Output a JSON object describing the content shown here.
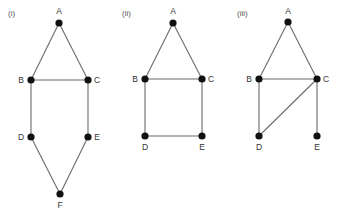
{
  "graphs": [
    {
      "label": "(i)",
      "label_pos": [
        8,
        16
      ],
      "nodes": [
        {
          "id": "A",
          "x": 59,
          "y": 23,
          "lx": 59,
          "ly": 14,
          "anchor": "middle"
        },
        {
          "id": "B",
          "x": 31,
          "y": 80,
          "lx": 21,
          "ly": 83,
          "anchor": "middle"
        },
        {
          "id": "C",
          "x": 88,
          "y": 80,
          "lx": 97,
          "ly": 83,
          "anchor": "middle"
        },
        {
          "id": "D",
          "x": 31,
          "y": 137,
          "lx": 21,
          "ly": 140,
          "anchor": "middle"
        },
        {
          "id": "E",
          "x": 88,
          "y": 137,
          "lx": 97,
          "ly": 140,
          "anchor": "middle"
        },
        {
          "id": "F",
          "x": 60,
          "y": 194,
          "lx": 60,
          "ly": 208,
          "anchor": "middle"
        }
      ],
      "edges": [
        [
          "A",
          "B"
        ],
        [
          "A",
          "C"
        ],
        [
          "B",
          "C"
        ],
        [
          "B",
          "D"
        ],
        [
          "C",
          "E"
        ],
        [
          "D",
          "F"
        ],
        [
          "E",
          "F"
        ]
      ]
    },
    {
      "label": "(ii)",
      "label_pos": [
        122,
        16
      ],
      "nodes": [
        {
          "id": "A",
          "x": 173,
          "y": 23,
          "lx": 173,
          "ly": 14,
          "anchor": "middle"
        },
        {
          "id": "B",
          "x": 145,
          "y": 79,
          "lx": 135,
          "ly": 82,
          "anchor": "middle"
        },
        {
          "id": "C",
          "x": 202,
          "y": 79,
          "lx": 211,
          "ly": 82,
          "anchor": "middle"
        },
        {
          "id": "D",
          "x": 145,
          "y": 136,
          "lx": 145,
          "ly": 150,
          "anchor": "middle"
        },
        {
          "id": "E",
          "x": 202,
          "y": 136,
          "lx": 202,
          "ly": 150,
          "anchor": "middle"
        }
      ],
      "edges": [
        [
          "A",
          "B"
        ],
        [
          "A",
          "C"
        ],
        [
          "B",
          "C"
        ],
        [
          "B",
          "D"
        ],
        [
          "C",
          "E"
        ],
        [
          "D",
          "E"
        ]
      ]
    },
    {
      "label": "(iii)",
      "label_pos": [
        237,
        16
      ],
      "nodes": [
        {
          "id": "A",
          "x": 288,
          "y": 22,
          "lx": 288,
          "ly": 14,
          "anchor": "middle"
        },
        {
          "id": "B",
          "x": 259,
          "y": 79,
          "lx": 249,
          "ly": 82,
          "anchor": "middle"
        },
        {
          "id": "C",
          "x": 317,
          "y": 79,
          "lx": 326,
          "ly": 82,
          "anchor": "middle"
        },
        {
          "id": "D",
          "x": 259,
          "y": 136,
          "lx": 259,
          "ly": 150,
          "anchor": "middle"
        },
        {
          "id": "E",
          "x": 317,
          "y": 136,
          "lx": 317,
          "ly": 150,
          "anchor": "middle"
        }
      ],
      "edges": [
        [
          "A",
          "B"
        ],
        [
          "A",
          "C"
        ],
        [
          "B",
          "C"
        ],
        [
          "B",
          "D"
        ],
        [
          "C",
          "D"
        ],
        [
          "C",
          "E"
        ]
      ]
    }
  ],
  "style": {
    "edge_color": "#6b6b6b",
    "node_color": "#111111",
    "node_radius": 3.6,
    "background": "#ffffff"
  }
}
